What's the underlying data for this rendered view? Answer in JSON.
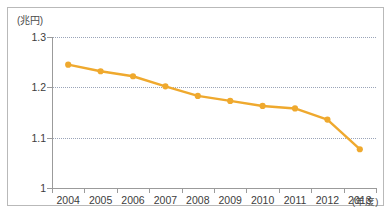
{
  "figure": {
    "unit_label": "(兆円)",
    "x_axis_unit": "(年度)",
    "frame_border_color": "#b9b9b9",
    "axis_color": "#9b9b9b",
    "grid_color": "#9aa4b8",
    "series_color": "#efa92e",
    "background": "#ffffff"
  },
  "chart_data": {
    "type": "line",
    "title": "",
    "subtitle": "",
    "xlabel": "(年度)",
    "ylabel": "(兆円)",
    "categories": [
      "2004",
      "2005",
      "2006",
      "2007",
      "2008",
      "2009",
      "2010",
      "2011",
      "2012",
      "2013"
    ],
    "values": [
      1.245,
      1.232,
      1.222,
      1.202,
      1.183,
      1.173,
      1.163,
      1.158,
      1.136,
      1.077
    ],
    "series": [
      {
        "name": "金額",
        "color": "#efa92e",
        "values": [
          1.245,
          1.232,
          1.222,
          1.202,
          1.183,
          1.173,
          1.163,
          1.158,
          1.136,
          1.077
        ]
      }
    ],
    "ylim": [
      1.0,
      1.3
    ],
    "y_ticks": [
      1.3,
      1.2,
      1.1,
      1.0
    ],
    "y_tick_labels": [
      "1.3",
      "1.2",
      "1.1",
      "1"
    ],
    "x_tick_labels": [
      "2004",
      "2005",
      "2006",
      "2007",
      "2008",
      "2009",
      "2010",
      "2011",
      "2012",
      "2013"
    ],
    "gridlines": {
      "horizontal": [
        1.3,
        1.2,
        1.1
      ],
      "vertical": []
    },
    "grid": true,
    "legend": null,
    "legend_position": "none",
    "markers": true,
    "annotations": []
  }
}
